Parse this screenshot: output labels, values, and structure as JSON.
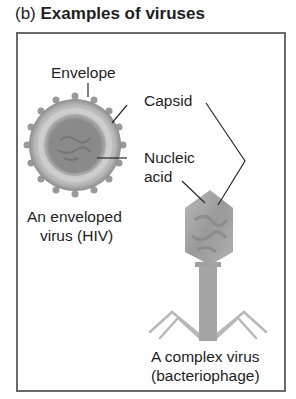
{
  "figure": {
    "title_prefix": "(b)",
    "title": "Examples of viruses",
    "labels": {
      "envelope": "Envelope",
      "capsid": "Capsid",
      "nucleic_line1": "Nucleic",
      "nucleic_line2": "acid",
      "hiv_line1": "An enveloped",
      "hiv_line2": "virus (HIV)",
      "phage_line1": "A complex virus",
      "phage_line2": "(bacteriophage)"
    },
    "colors": {
      "frame": "#6a6a6a",
      "envelope": "#9a9a9a",
      "capsid": "#c8c8c8",
      "core": "#8e8e8e",
      "leader": "#2a2a2a",
      "phage": "#a8a8a8"
    }
  }
}
